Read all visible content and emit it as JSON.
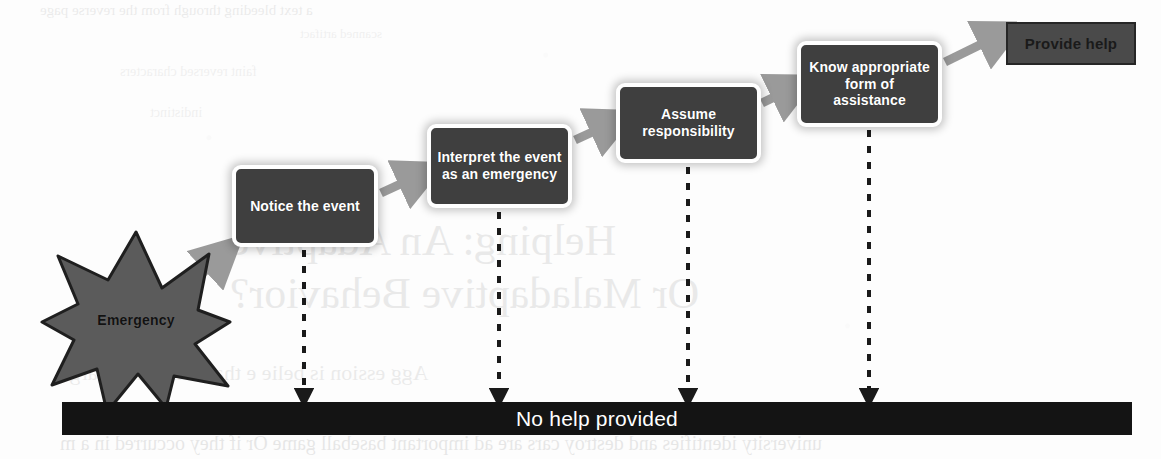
{
  "diagram": {
    "background_color": "#fdfdfd",
    "step_fill_color": "#3f3f3f",
    "step_text_color": "#ffffff",
    "connector_color": "#9a9a9a",
    "dashed_color": "#1a1a1a",
    "bar_color": "#141414",
    "star_fill_color": "#5b5b5b",
    "star_stroke_color": "#1f1f1f"
  },
  "trigger": {
    "label": "Emergency",
    "shape": "8-point-starburst"
  },
  "steps": [
    {
      "id": "notice",
      "label": "Notice the event"
    },
    {
      "id": "interpret",
      "label": "Interpret the event as an emergency"
    },
    {
      "id": "responsibility",
      "label": "Assume responsibility"
    },
    {
      "id": "know",
      "label": "Know appropriate form of assistance"
    }
  ],
  "outcome_success": {
    "label": "Provide help"
  },
  "outcome_failure": {
    "label": "No help provided"
  },
  "bleed_text": {
    "line1": "a text bleeding through from the reverse page",
    "line2": "scanned artifact",
    "line3": "faint reversed characters",
    "line4": "indistinct",
    "line5": "Helping: An Adaptive",
    "line6": "Or Maladaptive Behavior?",
    "line7": "Agg ession is belie e that C  harmed  Large",
    "line8": "university identifies and destroy cars are ad important baseball game Or if they occurred in a m"
  }
}
